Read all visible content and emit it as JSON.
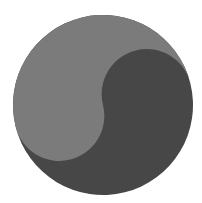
{
  "symbol": {
    "name": "yin-yang",
    "colors": {
      "dark": "#474747",
      "light": "#7b7b7b",
      "background": "#ffffff"
    },
    "geometry": {
      "cx": 103,
      "cy": 105,
      "r": 90,
      "dot_r": 13,
      "rotation_deg": -14
    }
  }
}
